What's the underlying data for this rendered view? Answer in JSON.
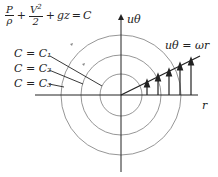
{
  "equation": {
    "p_num": "P",
    "p_den": "ρ",
    "plus1": "+",
    "v_num": "V",
    "v_exp": "2",
    "v_den": "2",
    "plus2": "+",
    "gz": "gz",
    "equals": "=",
    "rhs": "C"
  },
  "labels": {
    "c1": "C = C₁",
    "c2": "C = C₂",
    "c3": "C = C₃",
    "u_axis": "uθ",
    "r_axis": "r",
    "velocity_law": "uθ = ωr"
  },
  "geometry": {
    "center": [
      121,
      95
    ],
    "circle_radii": [
      21,
      40,
      60
    ],
    "line_color": "#222222",
    "circle_color": "#888888"
  }
}
